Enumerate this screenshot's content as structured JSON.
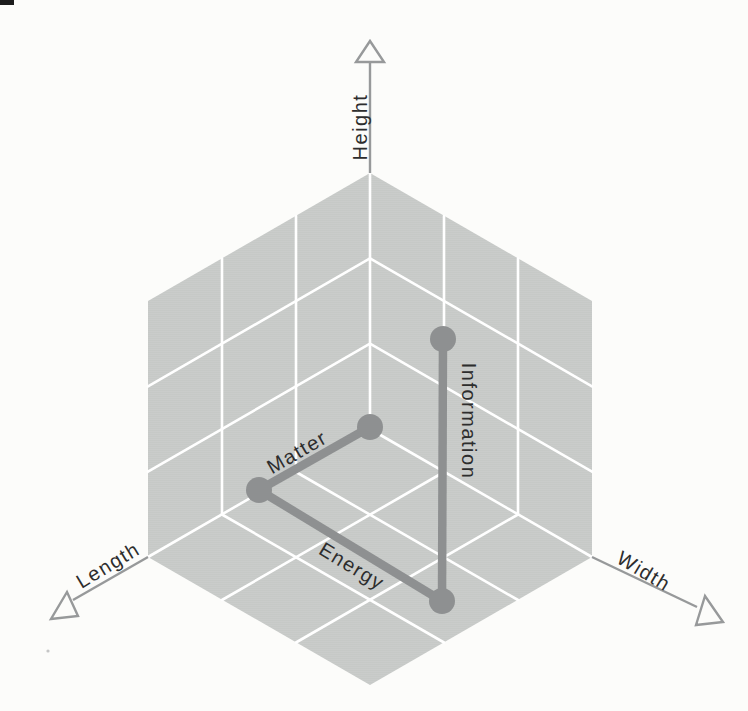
{
  "figure": {
    "axes": {
      "vertical": "Height",
      "lower_left": "Length",
      "lower_right": "Width"
    },
    "segments": {
      "matter": "Matter",
      "energy": "Energy",
      "information": "Information"
    },
    "colors": {
      "background": "#fcfcfa",
      "face": "#c7c9c8",
      "face_weave_dark": "#bfc1c0",
      "face_weave_light": "#cfd1d0",
      "grid": "#ffffff",
      "segment": "#8e9091",
      "axis": "#97999a",
      "text": "#2d2d2d",
      "artifact": "#1c1c1c"
    }
  }
}
